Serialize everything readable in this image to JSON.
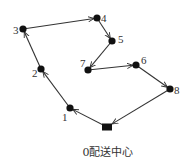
{
  "diagram": {
    "type": "vehicle-route",
    "depot": {
      "id": 0,
      "label": "0配送中心",
      "x": 107,
      "y": 127
    },
    "nodes": [
      {
        "id": 1,
        "label": "1",
        "x": 70,
        "y": 108,
        "lx": 62,
        "ly": 121
      },
      {
        "id": 2,
        "label": "2",
        "x": 41,
        "y": 69,
        "lx": 32,
        "ly": 77
      },
      {
        "id": 3,
        "label": "3",
        "x": 23,
        "y": 29,
        "lx": 13,
        "ly": 34
      },
      {
        "id": 4,
        "label": "4",
        "x": 97,
        "y": 18,
        "lx": 101,
        "ly": 22
      },
      {
        "id": 5,
        "label": "5",
        "x": 112,
        "y": 41,
        "lx": 118,
        "ly": 43
      },
      {
        "id": 6,
        "label": "6",
        "x": 136,
        "y": 65,
        "lx": 141,
        "ly": 64
      },
      {
        "id": 7,
        "label": "7",
        "x": 88,
        "y": 70,
        "lx": 80,
        "ly": 67
      },
      {
        "id": 8,
        "label": "8",
        "x": 170,
        "y": 89,
        "lx": 174,
        "ly": 94
      }
    ],
    "route": [
      0,
      1,
      2,
      3,
      4,
      5,
      7,
      6,
      8,
      0
    ],
    "colors": {
      "line": "#333333",
      "node": "#111111",
      "text": "#333333"
    }
  }
}
